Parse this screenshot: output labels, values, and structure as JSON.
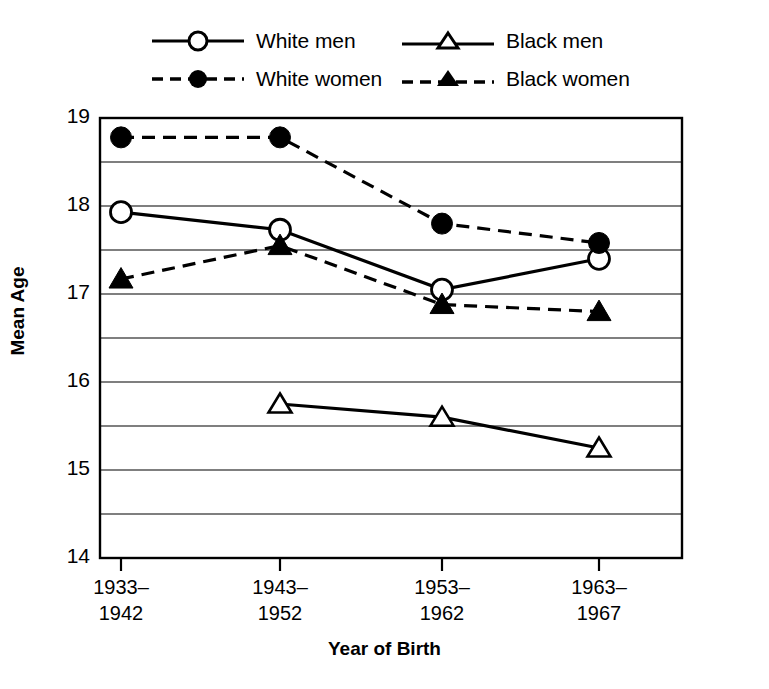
{
  "chart_data": {
    "type": "line",
    "title": "",
    "xlabel": "Year of Birth",
    "ylabel": "Mean Age",
    "categories": [
      "1933–\n1942",
      "1943–\n1952",
      "1953–\n1962",
      "1963–\n1967"
    ],
    "category_lines": [
      [
        "1933–",
        "1942"
      ],
      [
        "1943–",
        "1952"
      ],
      [
        "1953–",
        "1962"
      ],
      [
        "1963–",
        "1967"
      ]
    ],
    "ylim": [
      14,
      19
    ],
    "yticks": [
      14,
      15,
      16,
      17,
      18,
      19
    ],
    "ytick_labels": [
      "14",
      "15",
      "16",
      "17",
      "18",
      "19"
    ],
    "gridlines": [
      14.5,
      15,
      15.5,
      16,
      16.5,
      17,
      17.5,
      18,
      18.5
    ],
    "grid": true,
    "legend_position": "above-plot",
    "series": [
      {
        "name": "White men",
        "marker": "open-circle",
        "line": "solid",
        "color": "#000000",
        "values": [
          17.93,
          17.73,
          17.05,
          17.4
        ]
      },
      {
        "name": "White women",
        "marker": "filled-circle",
        "line": "dashed",
        "color": "#000000",
        "values": [
          18.78,
          18.78,
          17.8,
          17.58
        ]
      },
      {
        "name": "Black men",
        "marker": "open-triangle",
        "line": "solid",
        "color": "#000000",
        "values": [
          null,
          15.75,
          15.6,
          15.25
        ]
      },
      {
        "name": "Black women",
        "marker": "filled-triangle",
        "line": "dashed",
        "color": "#000000",
        "values": [
          17.17,
          17.55,
          16.88,
          16.8
        ]
      }
    ]
  },
  "legend": {
    "entries": [
      {
        "label": "White men"
      },
      {
        "label": "Black men"
      },
      {
        "label": "White women"
      },
      {
        "label": "Black women"
      }
    ]
  },
  "axes": {
    "y_title": "Mean Age",
    "x_title": "Year of Birth",
    "y_labels": [
      "19",
      "18",
      "17",
      "16",
      "15",
      "14"
    ],
    "x_labels_top": [
      "1933–",
      "1943–",
      "1953–",
      "1963–"
    ],
    "x_labels_bottom": [
      "1942",
      "1952",
      "1962",
      "1967"
    ]
  },
  "colors": {
    "ink": "#000000",
    "grid": "#555555",
    "background": "#ffffff"
  }
}
